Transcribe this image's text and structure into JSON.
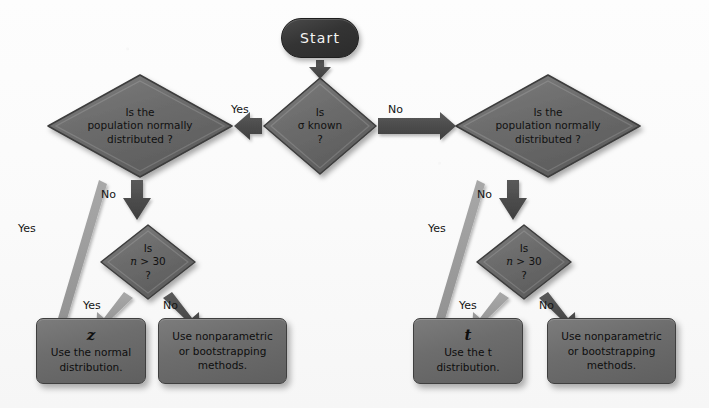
{
  "diagram": {
    "colors": {
      "node_fill": "#6d6d6d",
      "node_border": "#3f3f3f",
      "start_fill": "#343434",
      "arrow_dark": "#4a4a4a",
      "arrow_light": "#9b9b9b",
      "text": "#111111",
      "background": "#fafafa"
    }
  },
  "start": {
    "label": "Start"
  },
  "decisions": {
    "sigma": {
      "lines": [
        "Is",
        "σ known",
        "?"
      ]
    },
    "pop_left": {
      "lines": [
        "Is the",
        "population normally",
        "distributed ?"
      ]
    },
    "pop_right": {
      "lines": [
        "Is the",
        "population normally",
        "distributed ?"
      ]
    },
    "n30_left": {
      "lines": [
        "Is",
        "n > 30",
        "?"
      ],
      "italic_var": "n",
      "rest": " > 30"
    },
    "n30_right": {
      "lines": [
        "Is",
        "n > 30",
        "?"
      ],
      "italic_var": "n",
      "rest": " > 30"
    }
  },
  "terminals": {
    "z_box": {
      "symbol": "z",
      "lines": [
        "Use the normal",
        "distribution."
      ]
    },
    "nonparam_left": {
      "lines": [
        "Use nonparametric",
        "or bootstrapping",
        "methods."
      ]
    },
    "t_box": {
      "symbol": "t",
      "lines": [
        "Use the t",
        "distribution."
      ]
    },
    "nonparam_right": {
      "lines": [
        "Use nonparametric",
        "or bootstrapping",
        "methods."
      ]
    }
  },
  "edges": {
    "sigma_yes": "Yes",
    "sigma_no": "No",
    "pop_left_yes": "Yes",
    "pop_left_no": "No",
    "pop_right_yes": "Yes",
    "pop_right_no": "No",
    "n30_left_yes": "Yes",
    "n30_left_no": "No",
    "n30_right_yes": "Yes",
    "n30_right_no": "No"
  }
}
